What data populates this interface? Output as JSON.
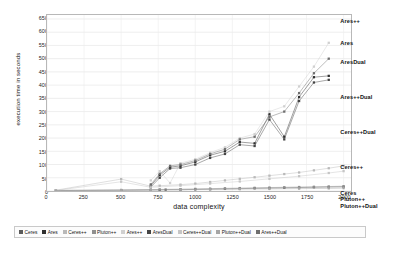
{
  "chart_data": {
    "type": "scatter",
    "title": "",
    "xlabel": "data complexity",
    "ylabel": "execution time in seconds",
    "xlim": [
      0,
      2050
    ],
    "ylim": [
      0,
      665
    ],
    "grid": true,
    "legend_position": "bottom",
    "xticks": [
      0,
      250,
      500,
      750,
      1000,
      1250,
      1500,
      1750,
      2000
    ],
    "yticks": [
      0,
      50,
      100,
      150,
      200,
      250,
      300,
      350,
      400,
      450,
      500,
      550,
      600,
      650
    ],
    "series": [
      {
        "name": "Ceres",
        "color": "#5a5a5a",
        "marker": "square",
        "x": [
          60,
          500,
          700,
          760,
          800,
          900,
          1000,
          1100,
          1200,
          1300,
          1400,
          1500,
          1600,
          1700,
          1800,
          1900,
          2000
        ],
        "y": [
          2,
          3,
          4,
          4,
          5,
          5,
          6,
          7,
          8,
          9,
          10,
          11,
          12,
          13,
          14,
          15,
          16
        ]
      },
      {
        "name": "Ares",
        "color": "#2f2f2f",
        "marker": "square",
        "x": [
          700,
          760,
          830,
          900,
          1000,
          1100,
          1200,
          1300,
          1400,
          1500,
          1600,
          1700,
          1800,
          1900
        ],
        "y": [
          20,
          60,
          90,
          95,
          110,
          135,
          150,
          185,
          180,
          290,
          205,
          355,
          430,
          435
        ]
      },
      {
        "name": "Ceres++",
        "color": "#b9b9b9",
        "marker": "square",
        "x": [
          60,
          500,
          700,
          760,
          900,
          1000,
          1100,
          1200,
          1300,
          1400,
          1500,
          1600,
          1700,
          1800,
          1900,
          2000
        ],
        "y": [
          3,
          45,
          18,
          20,
          24,
          28,
          34,
          40,
          46,
          52,
          58,
          64,
          70,
          78,
          86,
          95
        ]
      },
      {
        "name": "Pluton++",
        "color": "#8f8f8f",
        "marker": "square",
        "x": [
          60,
          500,
          700,
          760,
          900,
          1000,
          1100,
          1200,
          1300,
          1400,
          1500,
          1600,
          1700,
          1800,
          1900,
          2000
        ],
        "y": [
          2,
          4,
          5,
          6,
          7,
          8,
          9,
          10,
          11,
          12,
          13,
          14,
          15,
          16,
          17,
          18
        ]
      },
      {
        "name": "Ares++",
        "color": "#d0d0d0",
        "marker": "square",
        "x": [
          700,
          760,
          830,
          900,
          1000,
          1100,
          1200,
          1300,
          1400,
          1500,
          1600,
          1700,
          1800,
          1900
        ],
        "y": [
          40,
          75,
          30,
          105,
          120,
          145,
          165,
          200,
          215,
          300,
          320,
          395,
          470,
          560
        ]
      },
      {
        "name": "AresDual",
        "color": "#444444",
        "marker": "square",
        "x": [
          700,
          760,
          830,
          900,
          1000,
          1100,
          1200,
          1300,
          1400,
          1500,
          1600,
          1700,
          1800,
          1900
        ],
        "y": [
          15,
          50,
          85,
          88,
          100,
          125,
          140,
          175,
          170,
          270,
          195,
          340,
          410,
          420
        ]
      },
      {
        "name": "Ceres++Dual",
        "color": "#c6c6c6",
        "marker": "square",
        "x": [
          60,
          500,
          700,
          900,
          1100,
          1300,
          1500,
          1700,
          1900,
          2000
        ],
        "y": [
          2,
          35,
          14,
          20,
          28,
          36,
          46,
          56,
          68,
          75
        ]
      },
      {
        "name": "Pluton++Dual",
        "color": "#a5a5a5",
        "marker": "square",
        "x": [
          60,
          500,
          700,
          900,
          1100,
          1300,
          1500,
          1700,
          1900,
          2000
        ],
        "y": [
          1,
          3,
          4,
          5,
          6,
          7,
          8,
          9,
          10,
          11
        ]
      },
      {
        "name": "Ares++Dual",
        "color": "#6e6e6e",
        "marker": "square",
        "x": [
          700,
          760,
          830,
          900,
          1000,
          1100,
          1200,
          1300,
          1400,
          1500,
          1600,
          1700,
          1800,
          1900
        ],
        "y": [
          25,
          65,
          95,
          100,
          115,
          140,
          158,
          195,
          205,
          280,
          300,
          370,
          445,
          500
        ]
      }
    ],
    "annotations": [
      {
        "label": "Ares++",
        "x": 1945,
        "y": 640
      },
      {
        "label": "Ares",
        "x": 1945,
        "y": 555
      },
      {
        "label": "AresDual",
        "x": 1945,
        "y": 487
      },
      {
        "label": "Ares++Dual",
        "x": 1945,
        "y": 355
      },
      {
        "label": "Ceres++Dual",
        "x": 1945,
        "y": 225
      },
      {
        "label": "Ceres++",
        "x": 1945,
        "y": 95
      },
      {
        "label": "Ceres",
        "x": 1945,
        "y": -2
      },
      {
        "label": "Pluton++",
        "x": 1945,
        "y": -28
      },
      {
        "label": "Pluton++Dual",
        "x": 1945,
        "y": -54
      }
    ]
  },
  "legend": {
    "items": [
      {
        "label": "Ceres",
        "color": "#5a5a5a"
      },
      {
        "label": "Ares",
        "color": "#2f2f2f"
      },
      {
        "label": "Ceres++",
        "color": "#b9b9b9"
      },
      {
        "label": "Pluton++",
        "color": "#8f8f8f"
      },
      {
        "label": "Ares++",
        "color": "#d0d0d0"
      },
      {
        "label": "AresDual",
        "color": "#444444"
      },
      {
        "label": "Ceres++Dual",
        "color": "#c6c6c6"
      },
      {
        "label": "Pluton++Dual",
        "color": "#a5a5a5"
      },
      {
        "label": "Ares++Dual",
        "color": "#6e6e6e"
      }
    ]
  }
}
